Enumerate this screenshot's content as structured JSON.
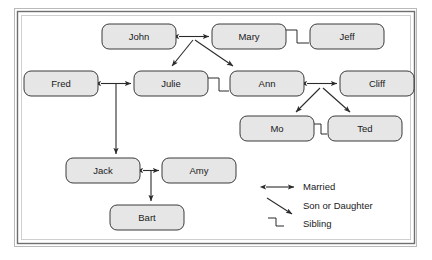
{
  "diagram": {
    "type": "family-tree",
    "nodes": [
      {
        "id": "john",
        "label": "John",
        "x": 102,
        "y": 24,
        "w": 74,
        "h": 25
      },
      {
        "id": "mary",
        "label": "Mary",
        "x": 212,
        "y": 24,
        "w": 74,
        "h": 25
      },
      {
        "id": "jeff",
        "label": "Jeff",
        "x": 310,
        "y": 24,
        "w": 74,
        "h": 25
      },
      {
        "id": "fred",
        "label": "Fred",
        "x": 24,
        "y": 71,
        "w": 74,
        "h": 25
      },
      {
        "id": "julie",
        "label": "Julie",
        "x": 134,
        "y": 71,
        "w": 74,
        "h": 25
      },
      {
        "id": "ann",
        "label": "Ann",
        "x": 230,
        "y": 71,
        "w": 74,
        "h": 25
      },
      {
        "id": "cliff",
        "label": "Cliff",
        "x": 340,
        "y": 71,
        "w": 74,
        "h": 25
      },
      {
        "id": "mo",
        "label": "Mo",
        "x": 240,
        "y": 116,
        "w": 74,
        "h": 25
      },
      {
        "id": "ted",
        "label": "Ted",
        "x": 328,
        "y": 116,
        "w": 74,
        "h": 25
      },
      {
        "id": "jack",
        "label": "Jack",
        "x": 66,
        "y": 158,
        "w": 74,
        "h": 25
      },
      {
        "id": "amy",
        "label": "Amy",
        "x": 162,
        "y": 158,
        "w": 74,
        "h": 25
      },
      {
        "id": "bart",
        "label": "Bart",
        "x": 110,
        "y": 205,
        "w": 74,
        "h": 25
      }
    ],
    "relations": [
      {
        "type": "married",
        "from": "john",
        "to": "mary"
      },
      {
        "type": "sibling",
        "from": "mary",
        "to": "jeff"
      },
      {
        "type": "married",
        "from": "fred",
        "to": "julie"
      },
      {
        "type": "sibling",
        "from": "julie",
        "to": "ann"
      },
      {
        "type": "married",
        "from": "ann",
        "to": "cliff"
      },
      {
        "type": "sibling",
        "from": "mo",
        "to": "ted"
      },
      {
        "type": "married",
        "from": "jack",
        "to": "amy"
      },
      {
        "type": "child",
        "from": "john-mary",
        "to": "julie"
      },
      {
        "type": "child",
        "from": "john-mary",
        "to": "ann"
      },
      {
        "type": "child",
        "from": "ann-cliff",
        "to": "mo"
      },
      {
        "type": "child",
        "from": "ann-cliff",
        "to": "ted"
      },
      {
        "type": "child",
        "from": "fred-julie",
        "to": "jack"
      },
      {
        "type": "child",
        "from": "jack-amy",
        "to": "bart"
      }
    ]
  },
  "legend": {
    "items": [
      {
        "key": "married",
        "label": "Married",
        "glyph": "double-arrow-icon"
      },
      {
        "key": "son-or-daughter",
        "label": "Son or Daughter",
        "glyph": "diagonal-arrow-icon"
      },
      {
        "key": "sibling",
        "label": "Sibling",
        "glyph": "step-bracket-icon"
      }
    ]
  },
  "style": {
    "box_fill": "#e6e6e6",
    "box_stroke": "#3a3a3a",
    "edge_color": "#2b2b2b",
    "frame_color": "#6e6e6e",
    "background": "#ffffff"
  }
}
